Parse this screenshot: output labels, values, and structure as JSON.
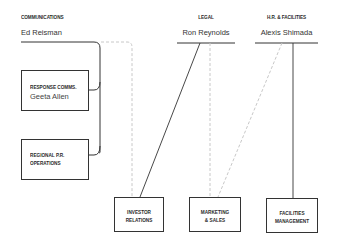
{
  "departments": {
    "communications": {
      "label": "Communications",
      "head": "Ed Reisman"
    },
    "legal": {
      "label": "Legal",
      "head": "Ron Reynolds"
    },
    "hr_facilities": {
      "label": "H.R. & Facilities",
      "head": "Alexis Shimada"
    }
  },
  "sub_units": {
    "response_comms": {
      "label": "Response Comms.",
      "head": "Geeta Allen"
    },
    "regional_pr": {
      "label": "Regional P.R.\nOperations",
      "label_line1": "Regional P.R.",
      "label_line2": "Operations"
    }
  },
  "bottom_units": {
    "investor_relations": {
      "label": "Investor\nRelations"
    },
    "marketing_sales": {
      "label": "Marketing\n& Sales"
    },
    "facilities_management": {
      "label": "Facilities\nManagement"
    }
  },
  "legend": {
    "solid_line": "direct report",
    "dashed_line": "dotted-line report"
  },
  "colors": {
    "line": "#333333",
    "dashed_line": "#c8c8c8",
    "background": "#ffffff"
  }
}
